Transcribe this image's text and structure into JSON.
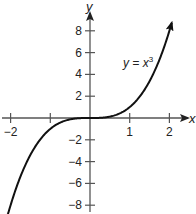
{
  "chart_data": {
    "type": "line",
    "title": "",
    "function_label": "y = x",
    "function_label_exponent": "3",
    "xlabel": "x",
    "ylabel": "y",
    "xlim": [
      -2.1,
      2.1
    ],
    "ylim": [
      -8.8,
      8.8
    ],
    "x_ticks": [
      -2,
      -1,
      1,
      2
    ],
    "x_tick_labels": [
      "−2",
      "",
      "1",
      "2"
    ],
    "y_ticks": [
      8,
      6,
      4,
      2,
      -2,
      -4,
      -6,
      -8
    ],
    "y_tick_labels": [
      "8",
      "6",
      "4",
      "2",
      "−2",
      "−4",
      "−6",
      "−8"
    ],
    "grid": false,
    "series": [
      {
        "name": "y = x^3",
        "x": [
          -2.06,
          -1.75,
          -1.5,
          -1.25,
          -1,
          -0.75,
          -0.5,
          -0.25,
          0,
          0.25,
          0.5,
          0.75,
          1,
          1.25,
          1.5,
          1.75,
          2.06
        ],
        "y": [
          -8.74,
          -5.36,
          -3.375,
          -1.95,
          -1,
          -0.42,
          -0.125,
          -0.016,
          0,
          0.016,
          0.125,
          0.42,
          1,
          1.95,
          3.375,
          5.36,
          8.74
        ]
      }
    ],
    "colors": {
      "axis": "#555555",
      "curve": "#111111",
      "text": "#222222"
    }
  }
}
